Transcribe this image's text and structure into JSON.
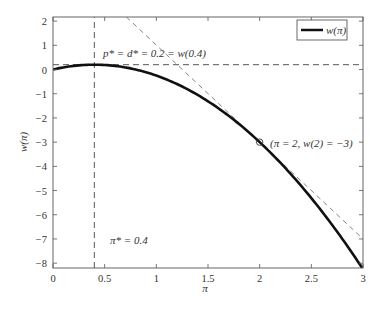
{
  "chart_data": {
    "type": "line",
    "title": "",
    "xlabel": "π",
    "ylabel": "w(π)",
    "xlim": [
      0,
      3
    ],
    "ylim": [
      -8.2,
      2.17
    ],
    "grid": false,
    "legend_position": "upper right",
    "x_ticks": [
      "0",
      "0.5",
      "1",
      "1.5",
      "2",
      "2.5",
      "3"
    ],
    "y_ticks": [
      "2",
      "1",
      "0",
      "−1",
      "−2",
      "−3",
      "−4",
      "−5",
      "−6",
      "−7",
      "−8"
    ],
    "series": [
      {
        "name": "w(π)",
        "style": "solid-thick",
        "formula": "w(π) = π − 1.25π²",
        "x": [
          0,
          0.2,
          0.4,
          0.6,
          0.8,
          1.0,
          1.2,
          1.4,
          1.6,
          1.8,
          2.0,
          2.2,
          2.4,
          2.6,
          2.8,
          3.0
        ],
        "y": [
          0,
          0.15,
          0.2,
          0.15,
          0.0,
          -0.25,
          -0.6,
          -1.05,
          -1.6,
          -2.25,
          -3.0,
          -3.85,
          -4.8,
          -5.85,
          -7.0,
          -8.25
        ]
      },
      {
        "name": "horizontal line p* = d*",
        "style": "dashed",
        "x": [
          0,
          3
        ],
        "y": [
          0.2,
          0.2
        ]
      },
      {
        "name": "vertical line π* = 0.4",
        "style": "dashed",
        "x": [
          0.4,
          0.4
        ],
        "y": [
          -8.2,
          2.17
        ]
      },
      {
        "name": "tangent at π = 2",
        "style": "dashed-thin",
        "slope": -4,
        "x": [
          0.71,
          3
        ],
        "y": [
          2.17,
          -7.0
        ]
      }
    ],
    "markers": [
      {
        "x": 2,
        "y": -3,
        "shape": "circle"
      }
    ],
    "annotations": [
      {
        "text": "p* = d* = 0.2 = w(0.4)",
        "x": 0.45,
        "y": 0.55
      },
      {
        "text": "(π = 2, w(2) = −3)",
        "x": 2.1,
        "y": -2.9
      },
      {
        "text": "π* = 0.4",
        "x": 0.5,
        "y": -7.1
      }
    ],
    "legend": [
      "w(π)"
    ]
  },
  "labels": {
    "xlabel": "π",
    "ylabel": "w(π)",
    "legend_label": "w(π)",
    "ann_top": "= d* = 0.2 = w(0.4)",
    "ann_top_p": "p",
    "ann_point": "(π = 2, w(2) = −3)",
    "ann_pi": "π* = 0.4"
  }
}
